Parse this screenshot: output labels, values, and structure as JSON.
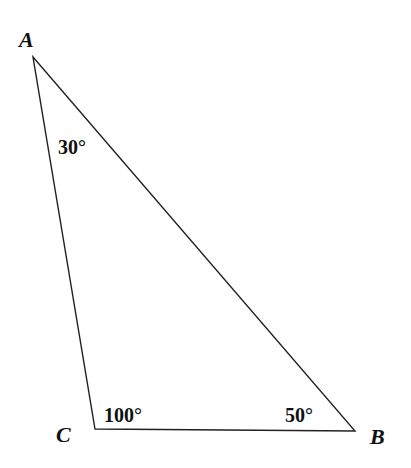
{
  "diagram": {
    "type": "triangle",
    "vertices": [
      {
        "label": "A",
        "x": 33,
        "y": 57
      },
      {
        "label": "B",
        "x": 355,
        "y": 431
      },
      {
        "label": "C",
        "x": 95,
        "y": 429
      }
    ],
    "angles": [
      {
        "vertex": "A",
        "label": "30°"
      },
      {
        "vertex": "C",
        "label": "100°"
      },
      {
        "vertex": "B",
        "label": "50°"
      }
    ],
    "stroke_color": "#222222"
  }
}
